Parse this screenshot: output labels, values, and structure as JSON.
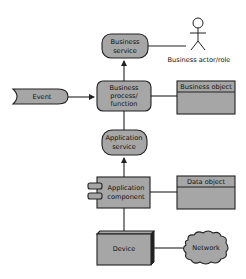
{
  "diagram": {
    "type": "ArchiMate layered overview",
    "colors": {
      "fill": "#a6a6a6",
      "stroke": "#222222",
      "background": "#ffffff"
    },
    "nodes": {
      "business_service": {
        "line1": "Business",
        "line2": "service"
      },
      "business_actor": {
        "label": "Business actor/role"
      },
      "event": {
        "label": "Event"
      },
      "business_process": {
        "line1": "Business",
        "line2": "process/",
        "line3": "function"
      },
      "business_object": {
        "label": "Business object"
      },
      "application_service": {
        "line1": "Application",
        "line2": "service"
      },
      "application_component": {
        "line1": "Application",
        "line2": "component"
      },
      "data_object": {
        "label": "Data object"
      },
      "device": {
        "label": "Device"
      },
      "network": {
        "label": "Network"
      }
    },
    "edges": [
      {
        "from": "business_process",
        "to": "business_service",
        "arrow": true
      },
      {
        "from": "business_service",
        "to": "business_actor",
        "arrow": false
      },
      {
        "from": "event",
        "to": "business_process",
        "arrow": true
      },
      {
        "from": "business_process",
        "to": "business_object",
        "arrow": false
      },
      {
        "from": "application_service",
        "to": "business_process",
        "arrow": false
      },
      {
        "from": "application_component",
        "to": "application_service",
        "arrow": true
      },
      {
        "from": "application_component",
        "to": "data_object",
        "arrow": false
      },
      {
        "from": "device",
        "to": "application_component",
        "arrow": false
      },
      {
        "from": "device",
        "to": "network",
        "arrow": false
      }
    ]
  }
}
